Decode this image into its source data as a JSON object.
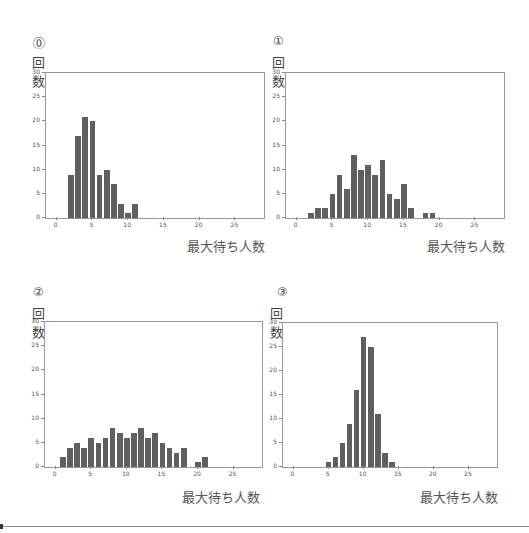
{
  "panels": [
    {
      "num": "⓪",
      "ylabel": "回数",
      "xlabel": "最大待ち人数"
    },
    {
      "num": "①",
      "ylabel": "回数",
      "xlabel": "最大待ち人数"
    },
    {
      "num": "②",
      "ylabel": "回数",
      "xlabel": "最大待ち人数"
    },
    {
      "num": "③",
      "ylabel": "回数",
      "xlabel": "最大待ち人数"
    }
  ],
  "chart_data": [
    {
      "type": "bar",
      "title": "⓪",
      "xlabel": "最大待ち人数",
      "ylabel": "回数",
      "x": [
        2,
        3,
        4,
        5,
        6,
        7,
        8,
        9,
        10,
        11
      ],
      "values": [
        9,
        17,
        21,
        20,
        9,
        10,
        7,
        3,
        1,
        3
      ],
      "xlim": [
        -1.5,
        29
      ],
      "ylim": [
        0,
        30
      ],
      "xticks": [
        0,
        5,
        10,
        15,
        20,
        25
      ],
      "yticks": [
        0,
        5,
        10,
        15,
        20,
        25,
        30
      ],
      "grid": false,
      "bar_color": "#5f5f5f"
    },
    {
      "type": "bar",
      "title": "①",
      "xlabel": "最大待ち人数",
      "ylabel": "回数",
      "x": [
        2,
        3,
        4,
        5,
        6,
        7,
        8,
        9,
        10,
        11,
        12,
        13,
        14,
        15,
        16,
        18,
        19
      ],
      "values": [
        1,
        2,
        2,
        5,
        9,
        6,
        13,
        10,
        11,
        9,
        12,
        5,
        4,
        7,
        2,
        1,
        1
      ],
      "xlim": [
        -1.5,
        29
      ],
      "ylim": [
        0,
        30
      ],
      "xticks": [
        0,
        5,
        10,
        15,
        20,
        25
      ],
      "yticks": [
        0,
        5,
        10,
        15,
        20,
        25,
        30
      ],
      "grid": false,
      "bar_color": "#5f5f5f"
    },
    {
      "type": "bar",
      "title": "②",
      "xlabel": "最大待ち人数",
      "ylabel": "回数",
      "x": [
        1,
        2,
        3,
        4,
        5,
        6,
        7,
        8,
        9,
        10,
        11,
        12,
        13,
        14,
        15,
        16,
        17,
        18,
        20,
        21
      ],
      "values": [
        2,
        4,
        5,
        4,
        6,
        5,
        6,
        8,
        7,
        6,
        7,
        8,
        6,
        7,
        5,
        4,
        3,
        4,
        1,
        2
      ],
      "xlim": [
        -1.5,
        29
      ],
      "ylim": [
        0,
        30
      ],
      "xticks": [
        0,
        5,
        10,
        15,
        20,
        25
      ],
      "yticks": [
        0,
        5,
        10,
        15,
        20,
        25,
        30
      ],
      "grid": false,
      "bar_color": "#5f5f5f"
    },
    {
      "type": "bar",
      "title": "③",
      "xlabel": "最大待ち人数",
      "ylabel": "回数",
      "x": [
        5,
        6,
        7,
        8,
        9,
        10,
        11,
        12,
        13,
        14
      ],
      "values": [
        1,
        2,
        5,
        9,
        16,
        27,
        25,
        11,
        3,
        1
      ],
      "xlim": [
        -1.5,
        29
      ],
      "ylim": [
        0,
        30
      ],
      "xticks": [
        0,
        5,
        10,
        15,
        20,
        25
      ],
      "yticks": [
        0,
        5,
        10,
        15,
        20,
        25,
        30
      ],
      "grid": false,
      "bar_color": "#5f5f5f"
    }
  ]
}
